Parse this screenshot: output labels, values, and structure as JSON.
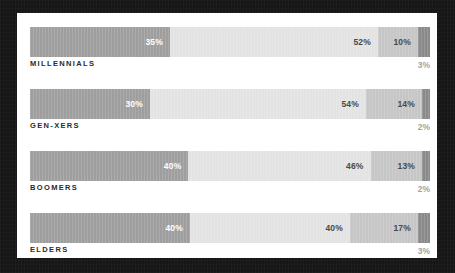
{
  "chart_data": {
    "type": "bar",
    "subtype": "stacked-horizontal-100",
    "title": "",
    "subtitle": "",
    "xlabel": "",
    "ylabel": "",
    "xlim": [
      0,
      100
    ],
    "grid": false,
    "legend": "none",
    "unit": "%",
    "categories": [
      "MILLENNIALS",
      "GEN-XERS",
      "BOOMERS",
      "ELDERS"
    ],
    "series": [
      {
        "name": "Segment 1",
        "color": "#9e9e9e",
        "values": [
          35,
          30,
          40,
          40
        ]
      },
      {
        "name": "Segment 2",
        "color": "#e3e3e3",
        "values": [
          52,
          54,
          46,
          40
        ]
      },
      {
        "name": "Segment 3",
        "color": "#c6c6c6",
        "values": [
          10,
          14,
          13,
          17
        ]
      },
      {
        "name": "Segment 4",
        "color": "#8a8a8a",
        "values": [
          3,
          2,
          2,
          3
        ]
      }
    ],
    "rows": [
      {
        "category": "MILLENNIALS",
        "segments": [
          {
            "value": 35,
            "label": "35%",
            "color": "#9e9e9e",
            "label_position": "inside"
          },
          {
            "value": 52,
            "label": "52%",
            "color": "#e3e3e3",
            "label_position": "inside"
          },
          {
            "value": 10,
            "label": "10%",
            "color": "#c6c6c6",
            "label_position": "inside"
          },
          {
            "value": 3,
            "label": "3%",
            "color": "#8a8a8a",
            "label_position": "below"
          }
        ]
      },
      {
        "category": "GEN-XERS",
        "segments": [
          {
            "value": 30,
            "label": "30%",
            "color": "#9e9e9e",
            "label_position": "inside"
          },
          {
            "value": 54,
            "label": "54%",
            "color": "#e3e3e3",
            "label_position": "inside"
          },
          {
            "value": 14,
            "label": "14%",
            "color": "#c6c6c6",
            "label_position": "inside"
          },
          {
            "value": 2,
            "label": "2%",
            "color": "#8a8a8a",
            "label_position": "below"
          }
        ]
      },
      {
        "category": "BOOMERS",
        "segments": [
          {
            "value": 40,
            "label": "40%",
            "color": "#9e9e9e",
            "label_position": "inside"
          },
          {
            "value": 46,
            "label": "46%",
            "color": "#e3e3e3",
            "label_position": "inside"
          },
          {
            "value": 13,
            "label": "13%",
            "color": "#c6c6c6",
            "label_position": "inside"
          },
          {
            "value": 2,
            "label": "2%",
            "color": "#8a8a8a",
            "label_position": "below"
          }
        ]
      },
      {
        "category": "ELDERS",
        "segments": [
          {
            "value": 40,
            "label": "40%",
            "color": "#9e9e9e",
            "label_position": "inside"
          },
          {
            "value": 40,
            "label": "40%",
            "color": "#e3e3e3",
            "label_position": "inside"
          },
          {
            "value": 17,
            "label": "17%",
            "color": "#c6c6c6",
            "label_position": "inside"
          },
          {
            "value": 3,
            "label": "3%",
            "color": "#8a8a8a",
            "label_position": "below"
          }
        ]
      }
    ]
  },
  "theme": {
    "frame_color": "#161616",
    "card_color": "#ffffff",
    "category_label_color": "#2b2b2b",
    "inside_light_label_color": "#ffffff",
    "inside_dark_label_color": "#4a4a4a",
    "outside_label_color": "#a3a3a3"
  }
}
